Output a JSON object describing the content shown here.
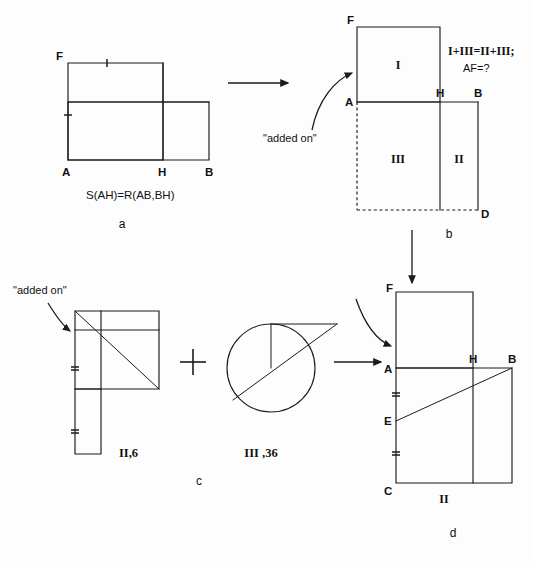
{
  "figure": {
    "background_color": "#fdfdfd",
    "ink_color": "#1b1b1b"
  },
  "panels": {
    "a": {
      "letter": "a",
      "formula": "S(AH)=R(AB,BH)",
      "vertices": {
        "F": "F",
        "A": "A",
        "H": "H",
        "B": "B"
      }
    },
    "b": {
      "letter": "b",
      "annotation": "\"added on\"",
      "equation_line1": "I+III=II+III;",
      "equation_line2": "AF=?",
      "vertices": {
        "F": "F",
        "A": "A",
        "H": "H",
        "B": "B",
        "D": "D"
      },
      "regions": {
        "I": "I",
        "II": "II",
        "III": "III"
      }
    },
    "c": {
      "letter": "c",
      "annotation_left": "\"added on\"",
      "annotation_right": "\"added on\"",
      "piece_left_label": "II,6",
      "piece_right_label": "III ,36",
      "operator": "+"
    },
    "d": {
      "letter": "d",
      "region_label": "II",
      "vertices": {
        "F": "F",
        "A": "A",
        "H": "H",
        "B": "B",
        "E": "E",
        "C": "C"
      }
    }
  }
}
